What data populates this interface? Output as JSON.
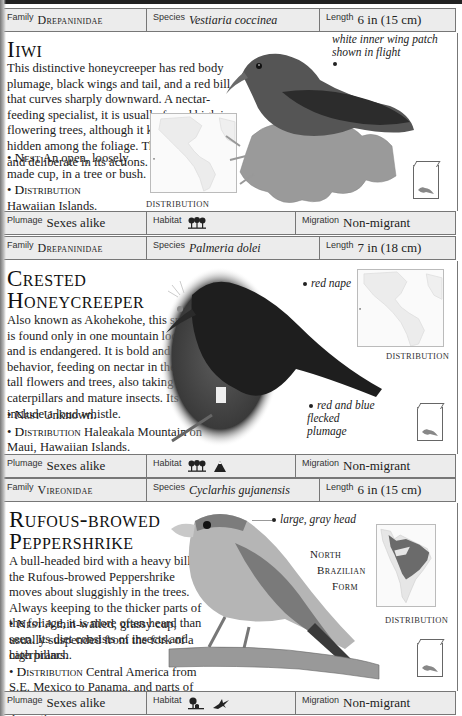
{
  "entries": [
    {
      "family_label": "Family",
      "family": "Drepaninidae",
      "species_label": "Species",
      "species": "Vestiaria coccinea",
      "length_label": "Length",
      "length": "6 in (15 cm)",
      "title_lines": [
        "Iiwi"
      ],
      "description": "This distinctive honeycreeper has red body plumage, black wings and tail, and a red bill that curves sharply downward. A nectar-feeding specialist, it is usually found high in flowering trees, although it keeps well hidden among the foliage. The Iiwi is slow and deliberate in its actions.",
      "nest_label": "Nest",
      "nest": "An open, loosely made cup, in a tree or bush.",
      "distribution_label": "Distribution",
      "distribution": "Hawaiian Islands.",
      "map_label": "Distribution",
      "annotations": [
        {
          "text": "white inner wing patch shown in flight"
        }
      ],
      "plumage_label": "Plumage",
      "plumage": "Sexes alike",
      "habitat_label": "Habitat",
      "habitat_icons": [
        "forest-icon"
      ],
      "migration_label": "Migration",
      "migration": "Non-migrant"
    },
    {
      "family_label": "Family",
      "family": "Drepaninidae",
      "species_label": "Species",
      "species": "Palmeria dolei",
      "length_label": "Length",
      "length": "7 in (18 cm)",
      "title_lines": [
        "Crested",
        "Honeycreeper"
      ],
      "description": "Also known as Akohekohe, this species is found only in one mountain locality and is endangered. It is bold and active in behavior, feeding on nectar in the tops of tall flowers and trees, also taking caterpillars and mature insects. Its calls include a loud whistle.",
      "nest_label": "Nest",
      "nest": "Unknown.",
      "distribution_label": "Distribution",
      "distribution": "Haleakala Mountain on Maui, Hawaiian Islands.",
      "map_label": "Distribution",
      "annotations": [
        {
          "text": "red nape"
        },
        {
          "text": "red and blue flecked plumage"
        }
      ],
      "plumage_label": "Plumage",
      "plumage": "Sexes alike",
      "habitat_label": "Habitat",
      "habitat_icons": [
        "forest-icon",
        "mountain-icon"
      ],
      "migration_label": "Migration",
      "migration": "Non-migrant"
    },
    {
      "family_label": "Family",
      "family": "Vireonidae",
      "species_label": "Species",
      "species": "Cyclarhis gujanensis",
      "length_label": "Length",
      "length": "6 in (15 cm)",
      "title_lines": [
        "Rufous-browed",
        "Peppershrike"
      ],
      "description": "A bull-headed bird with a heavy bill, the Rufous-browed Peppershrike moves about sluggishly in the trees. Always keeping to the thicker parts of the foliage, it is more often heard than seen. Its diet consists of insects and caterpillars.",
      "nest_label": "Nest",
      "nest": "A thin-walled, grassy cup, usually suspended from the fork of a high branch.",
      "distribution_label": "Distribution",
      "distribution": "Central America from S.E. Mexico to Panama, and parts of South America as far south as C. Argentina.",
      "map_label": "Distribution",
      "side_label_lines": [
        "North",
        "Brazilian",
        "Form"
      ],
      "annotations": [
        {
          "text": "large, gray head"
        }
      ],
      "plumage_label": "Plumage",
      "plumage": "Sexes alike",
      "habitat_label": "Habitat",
      "habitat_icons": [
        "woodland-edge-icon",
        "scrubland-icon"
      ],
      "migration_label": "Migration",
      "migration": "Non-migrant"
    }
  ]
}
